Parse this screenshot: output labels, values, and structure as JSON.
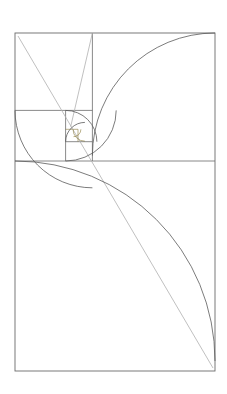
{
  "figure": {
    "kind": "geometric-diagram",
    "background_color": "#ffffff",
    "canvas": {
      "width": 227,
      "height": 394
    }
  },
  "palette": {
    "rectangle_stroke": "#6b6b6b",
    "square_stroke": "#6b6b6b",
    "spiral_stroke": "#5a5a5a",
    "diagonal_stroke": "#b0b0b0",
    "tiny_square_stroke": "#8a7a3a"
  },
  "strokes": {
    "outer_rect_width": 0.9,
    "divider_width": 0.8,
    "spiral_width": 0.8,
    "diagonal_width": 0.8,
    "tiny_width": 0.6
  },
  "geometry": {
    "outer_rect": {
      "x": 15,
      "y": 33,
      "width": 200,
      "height": 338
    },
    "ratio": 1.6180339887,
    "squares": [
      {
        "name": "square-1-bottom",
        "x": 15,
        "y": 161,
        "size": 200
      },
      {
        "name": "square-2-top-right",
        "x": 92.4,
        "y": 33,
        "size": 122.6
      },
      {
        "name": "square-3-top-left",
        "x": 15,
        "y": 33,
        "size": 77.4
      },
      {
        "name": "square-4-left-lower",
        "x": 15,
        "y": 110.4,
        "size": 50.6
      },
      {
        "name": "square-5-mid",
        "x": 65.6,
        "y": 110.4,
        "size": 31.3
      },
      {
        "name": "square-6",
        "x": 65.6,
        "y": 141.7,
        "size": 19.3
      },
      {
        "name": "square-7",
        "x": 78.0,
        "y": 129.3,
        "size": 11.9
      },
      {
        "name": "square-8",
        "x": 66.1,
        "y": 129.3,
        "size": 7.4
      },
      {
        "name": "square-9",
        "x": 66.1,
        "y": 123.8,
        "size": 4.6
      },
      {
        "name": "square-10",
        "x": 70.7,
        "y": 123.8,
        "size": 2.8
      }
    ],
    "dividers": [
      {
        "name": "divider-horizontal-main",
        "x1": 15,
        "y1": 161,
        "x2": 215,
        "y2": 161
      },
      {
        "name": "divider-vertical-top",
        "x1": 92.4,
        "y1": 33,
        "x2": 92.4,
        "y2": 161
      },
      {
        "name": "divider-horizontal-left",
        "x1": 15,
        "y1": 110.4,
        "x2": 92.4,
        "y2": 110.4
      },
      {
        "name": "divider-vertical-left",
        "x1": 65.6,
        "y1": 110.4,
        "x2": 65.6,
        "y2": 161
      },
      {
        "name": "divider-horizontal-mid",
        "x1": 65.6,
        "y1": 141.7,
        "x2": 92.4,
        "y2": 141.7
      },
      {
        "name": "divider-vertical-mid",
        "x1": 78.0,
        "y1": 129.3,
        "x2": 78.0,
        "y2": 141.7
      },
      {
        "name": "divider-horizontal-tiny",
        "x1": 65.6,
        "y1": 129.3,
        "x2": 78.0,
        "y2": 129.3
      }
    ],
    "diagonals": [
      {
        "name": "diagonal-main",
        "x1": 18,
        "y1": 36,
        "x2": 213,
        "y2": 368
      },
      {
        "name": "diagonal-secondary",
        "x1": 92.4,
        "y1": 33,
        "x2": 70.7,
        "y2": 126.6
      }
    ],
    "spiral_path": "M 15 161 A 200 200 0 0 1 215 361 L 215 361 M 215 33 A 122.6 122.6 0 0 1 92.4 155.6 M 92.4 33 A 77.4 77.4 0 0 0 15 110.4 M 15 110.4 A 50.6 50.6 0 0 0 65.6 161 M 65.6 161 A 31.3 31.3 0 0 0 96.9 129.7 M 96.9 129.7 A 19.3 19.3 0 0 0 77.6 110.4",
    "arcs": [
      {
        "name": "arc-1",
        "cx": 15,
        "cy": 361,
        "r": 200,
        "start_deg": 270,
        "sweep_deg": 90
      },
      {
        "name": "arc-2",
        "cx": 215,
        "cy": 155.6,
        "r": 122.6,
        "start_deg": 180,
        "sweep_deg": 90
      },
      {
        "name": "arc-3",
        "cx": 92.4,
        "cy": 110.4,
        "r": 77.4,
        "start_deg": 90,
        "sweep_deg": 90
      },
      {
        "name": "arc-4",
        "cx": 65.6,
        "cy": 110.4,
        "r": 50.6,
        "start_deg": 0,
        "sweep_deg": 90
      },
      {
        "name": "arc-5",
        "cx": 65.6,
        "cy": 141.7,
        "r": 31.3,
        "start_deg": 270,
        "sweep_deg": 90
      },
      {
        "name": "arc-6",
        "cx": 84.9,
        "cy": 141.7,
        "r": 19.3,
        "start_deg": 180,
        "sweep_deg": 90
      },
      {
        "name": "arc-7",
        "cx": 84.9,
        "cy": 129.3,
        "r": 11.9,
        "start_deg": 90,
        "sweep_deg": 90
      },
      {
        "name": "arc-8",
        "cx": 73.5,
        "cy": 129.3,
        "r": 7.4,
        "start_deg": 0,
        "sweep_deg": 90
      }
    ]
  }
}
